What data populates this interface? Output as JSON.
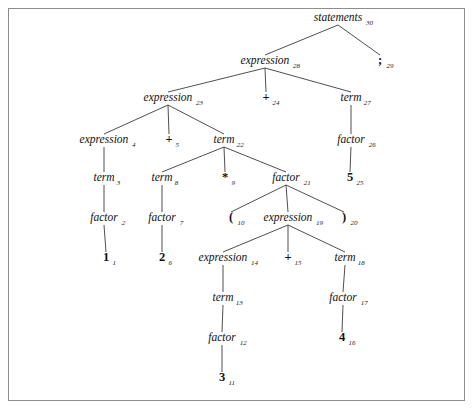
{
  "figure": {
    "kind": "parse-tree",
    "title": "",
    "border_color": "#8d8d8d",
    "edge_color": "#3b3b3b",
    "text_color": "#111111",
    "background": "#ffffff"
  },
  "chart_data": {
    "type": "diagram",
    "title": "",
    "nodes": [
      {
        "id": "n30",
        "label": "statements",
        "index": "30",
        "style": "nonterminal",
        "x": 338,
        "y": 21
      },
      {
        "id": "n29",
        "label": ";",
        "index": "29",
        "style": "terminal",
        "x": 380,
        "y": 64
      },
      {
        "id": "n28",
        "label": "expression",
        "index": "28",
        "style": "nonterminal",
        "x": 265,
        "y": 64
      },
      {
        "id": "n23",
        "label": "expression",
        "index": "23",
        "style": "nonterminal",
        "x": 168,
        "y": 101
      },
      {
        "id": "n24",
        "label": "+",
        "index": "24",
        "style": "terminal",
        "x": 266,
        "y": 101
      },
      {
        "id": "n27",
        "label": "term",
        "index": "27",
        "style": "nonterminal",
        "x": 351,
        "y": 101
      },
      {
        "id": "n4",
        "label": "expression",
        "index": "4",
        "style": "nonterminal",
        "x": 104,
        "y": 143
      },
      {
        "id": "n5",
        "label": "+",
        "index": "5",
        "style": "terminal",
        "x": 169,
        "y": 143
      },
      {
        "id": "n22",
        "label": "term",
        "index": "22",
        "style": "nonterminal",
        "x": 224,
        "y": 143
      },
      {
        "id": "n26",
        "label": "factor",
        "index": "26",
        "style": "nonterminal",
        "x": 351,
        "y": 143
      },
      {
        "id": "n3",
        "label": "term",
        "index": "3",
        "style": "nonterminal",
        "x": 104,
        "y": 181
      },
      {
        "id": "n8",
        "label": "term",
        "index": "8",
        "style": "nonterminal",
        "x": 162,
        "y": 181
      },
      {
        "id": "n9",
        "label": "*",
        "index": "9",
        "style": "terminal",
        "x": 225,
        "y": 181
      },
      {
        "id": "n21",
        "label": "factor",
        "index": "21",
        "style": "nonterminal",
        "x": 286,
        "y": 181
      },
      {
        "id": "n25",
        "label": "5",
        "index": "25",
        "style": "terminal",
        "x": 350,
        "y": 181
      },
      {
        "id": "n2",
        "label": "factor",
        "index": "2",
        "style": "nonterminal",
        "x": 104,
        "y": 221
      },
      {
        "id": "n7",
        "label": "factor",
        "index": "7",
        "style": "nonterminal",
        "x": 162,
        "y": 221
      },
      {
        "id": "n10",
        "label": "(",
        "index": "10",
        "style": "terminal",
        "x": 231,
        "y": 221
      },
      {
        "id": "n19",
        "label": "expression",
        "index": "19",
        "style": "nonterminal",
        "x": 288,
        "y": 221
      },
      {
        "id": "n20",
        "label": ")",
        "index": "20",
        "style": "terminal",
        "x": 344,
        "y": 221
      },
      {
        "id": "n1",
        "label": "1",
        "index": "1",
        "style": "terminal",
        "x": 106,
        "y": 261
      },
      {
        "id": "n6",
        "label": "2",
        "index": "6",
        "style": "terminal",
        "x": 162,
        "y": 261
      },
      {
        "id": "n14",
        "label": "expression",
        "index": "14",
        "style": "nonterminal",
        "x": 223,
        "y": 261
      },
      {
        "id": "n15",
        "label": "+",
        "index": "15",
        "style": "terminal",
        "x": 288,
        "y": 261
      },
      {
        "id": "n18",
        "label": "term",
        "index": "18",
        "style": "nonterminal",
        "x": 345,
        "y": 261
      },
      {
        "id": "n13",
        "label": "term",
        "index": "13",
        "style": "nonterminal",
        "x": 223,
        "y": 301
      },
      {
        "id": "n17",
        "label": "factor",
        "index": "17",
        "style": "nonterminal",
        "x": 343,
        "y": 301
      },
      {
        "id": "n12",
        "label": "factor",
        "index": "12",
        "style": "nonterminal",
        "x": 222,
        "y": 341
      },
      {
        "id": "n16",
        "label": "4",
        "index": "16",
        "style": "terminal",
        "x": 342,
        "y": 341
      },
      {
        "id": "n11",
        "label": "3",
        "index": "11",
        "style": "terminal",
        "x": 222,
        "y": 381
      }
    ],
    "edges": [
      {
        "from": "n30",
        "to": "n28"
      },
      {
        "from": "n30",
        "to": "n29"
      },
      {
        "from": "n28",
        "to": "n23"
      },
      {
        "from": "n28",
        "to": "n24"
      },
      {
        "from": "n28",
        "to": "n27"
      },
      {
        "from": "n23",
        "to": "n4"
      },
      {
        "from": "n23",
        "to": "n5"
      },
      {
        "from": "n23",
        "to": "n22"
      },
      {
        "from": "n27",
        "to": "n26"
      },
      {
        "from": "n4",
        "to": "n3"
      },
      {
        "from": "n22",
        "to": "n8"
      },
      {
        "from": "n22",
        "to": "n9"
      },
      {
        "from": "n22",
        "to": "n21"
      },
      {
        "from": "n26",
        "to": "n25"
      },
      {
        "from": "n3",
        "to": "n2"
      },
      {
        "from": "n8",
        "to": "n7"
      },
      {
        "from": "n21",
        "to": "n10"
      },
      {
        "from": "n21",
        "to": "n19"
      },
      {
        "from": "n21",
        "to": "n20"
      },
      {
        "from": "n2",
        "to": "n1"
      },
      {
        "from": "n7",
        "to": "n6"
      },
      {
        "from": "n19",
        "to": "n14"
      },
      {
        "from": "n19",
        "to": "n15"
      },
      {
        "from": "n19",
        "to": "n18"
      },
      {
        "from": "n14",
        "to": "n13"
      },
      {
        "from": "n18",
        "to": "n17"
      },
      {
        "from": "n13",
        "to": "n12"
      },
      {
        "from": "n17",
        "to": "n16"
      },
      {
        "from": "n12",
        "to": "n11"
      }
    ]
  }
}
